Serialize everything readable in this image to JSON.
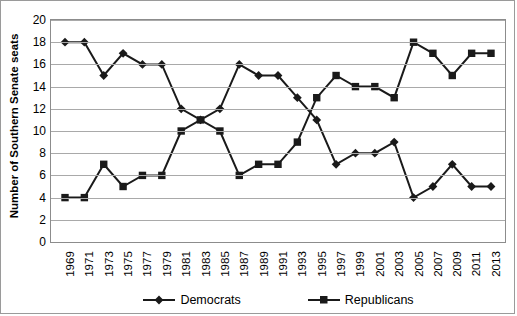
{
  "chart_data": {
    "type": "line",
    "title": "",
    "xlabel": "",
    "ylabel": "Number of Southern Senate seats",
    "ylim": [
      0,
      20
    ],
    "ytick_step": 2,
    "yticks": [
      20,
      18,
      16,
      14,
      12,
      10,
      8,
      6,
      4,
      2,
      0
    ],
    "grid": true,
    "legend_position": "bottom",
    "categories": [
      "1969",
      "1971",
      "1973",
      "1975",
      "1977",
      "1979",
      "1981",
      "1983",
      "1985",
      "1987",
      "1989",
      "1991",
      "1993",
      "1995",
      "1997",
      "1999",
      "2001",
      "2003",
      "2005",
      "2007",
      "2009",
      "2011",
      "2013"
    ],
    "series": [
      {
        "name": "Democrats",
        "marker": "diamond",
        "color": "#1a1a1a",
        "values": [
          18,
          18,
          15,
          17,
          16,
          16,
          12,
          11,
          12,
          16,
          15,
          15,
          13,
          11,
          7,
          8,
          8,
          9,
          4,
          5,
          7,
          5,
          5
        ]
      },
      {
        "name": "Republicans",
        "marker": "square",
        "color": "#1a1a1a",
        "values": [
          4,
          4,
          7,
          5,
          6,
          6,
          10,
          11,
          10,
          6,
          7,
          7,
          9,
          13,
          15,
          14,
          14,
          13,
          18,
          17,
          15,
          17,
          17
        ]
      }
    ]
  },
  "legend": {
    "items": [
      {
        "label": "Democrats",
        "marker": "diamond-marker"
      },
      {
        "label": "Republicans",
        "marker": "square-marker"
      }
    ]
  },
  "axes": {
    "y_label": "Number of Southern Senate seats"
  }
}
